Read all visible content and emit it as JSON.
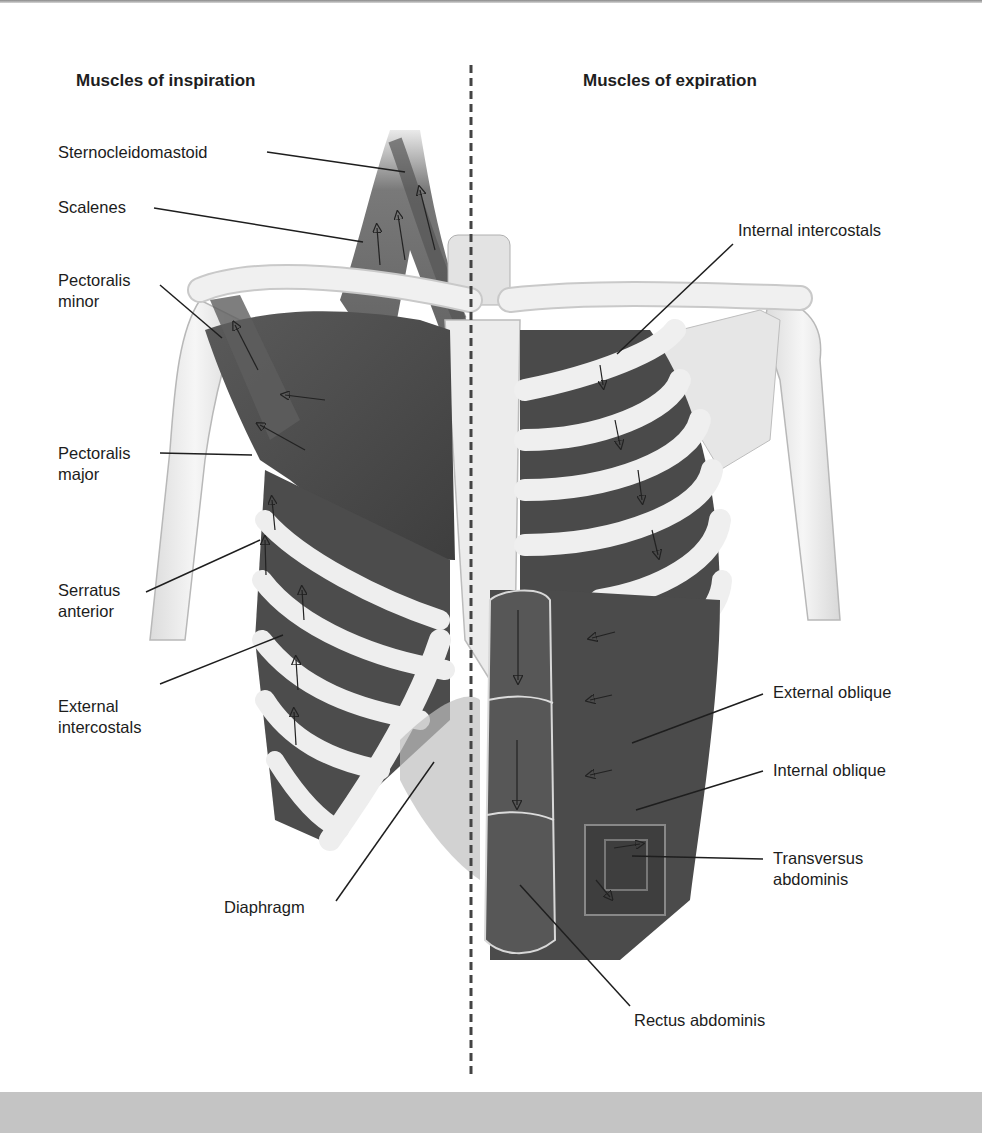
{
  "figure": {
    "headings": {
      "left": "Muscles of inspiration",
      "right": "Muscles of expiration"
    },
    "inspiration_labels": [
      {
        "id": "sternocleidomastoid",
        "lines": [
          "Sternocleidomastoid"
        ]
      },
      {
        "id": "scalenes",
        "lines": [
          "Scalenes"
        ]
      },
      {
        "id": "pectoralis-minor",
        "lines": [
          "Pectoralis",
          "minor"
        ]
      },
      {
        "id": "pectoralis-major",
        "lines": [
          "Pectoralis",
          "major"
        ]
      },
      {
        "id": "serratus-anterior",
        "lines": [
          "Serratus",
          "anterior"
        ]
      },
      {
        "id": "external-intercostals",
        "lines": [
          "External",
          "intercostals"
        ]
      },
      {
        "id": "diaphragm",
        "lines": [
          "Diaphragm"
        ]
      }
    ],
    "expiration_labels": [
      {
        "id": "internal-intercostals",
        "lines": [
          "Internal intercostals"
        ]
      },
      {
        "id": "external-oblique",
        "lines": [
          "External oblique"
        ]
      },
      {
        "id": "internal-oblique",
        "lines": [
          "Internal oblique"
        ]
      },
      {
        "id": "transversus-abdominis",
        "lines": [
          "Transversus",
          "abdominis"
        ]
      },
      {
        "id": "rectus-abdominis",
        "lines": [
          "Rectus abdominis"
        ]
      }
    ],
    "colors": {
      "muscle": "#4a4a4a",
      "bone": "#ededed",
      "bone_outline": "#a8a8a8",
      "leader_line": "#1e1e1e",
      "divider": "#444444",
      "bottom_band": "#c4c4c4"
    }
  }
}
